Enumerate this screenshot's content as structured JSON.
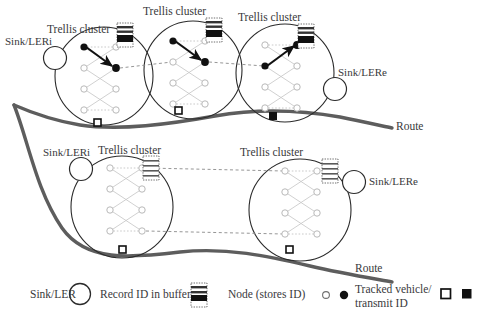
{
  "figure": {
    "colors": {
      "route": "#5d5d5d",
      "cluster_outline": "#2b2b2b",
      "node_inactive": "#b9b9b9",
      "node_active": "#111111",
      "trellis_link": "#bdbdbd",
      "dashed_link": "#8a8a8a",
      "text": "#39393b",
      "buffer_fill": "#111111",
      "background": "#ffffff"
    }
  },
  "rows": [
    {
      "id": "top-row",
      "sink_in_label": "Sink/LERi",
      "sink_out_label": "Sink/LERe",
      "route_label": "Route",
      "clusters": [
        {
          "id": "top-cluster-1",
          "label": "Trellis cluster",
          "buffer_filled": true,
          "vehicle_marker": "open"
        },
        {
          "id": "top-cluster-2",
          "label": "Trellis cluster",
          "buffer_filled": true,
          "vehicle_marker": "open"
        },
        {
          "id": "top-cluster-3",
          "label": "Trellis cluster",
          "buffer_filled": true,
          "vehicle_marker": "filled"
        }
      ]
    },
    {
      "id": "bottom-row",
      "sink_in_label": "Sink/LERi",
      "sink_out_label": "Sink/LERe",
      "route_label": "Route",
      "clusters": [
        {
          "id": "bottom-cluster-1",
          "label": "Trellis cluster",
          "buffer_filled": false,
          "vehicle_marker": "open"
        },
        {
          "id": "bottom-cluster-2",
          "label": "Trellis cluster",
          "buffer_filled": false,
          "vehicle_marker": "open"
        }
      ]
    }
  ],
  "legend": {
    "items": [
      {
        "id": "sink-ler",
        "label": "Sink/LER",
        "symbol": "circle-outline"
      },
      {
        "id": "record-buffer",
        "label": "Record ID in buffer",
        "symbol": "striped-buffer"
      },
      {
        "id": "node-stores-id",
        "label": "Node (stores ID)",
        "symbol": "open-and-filled-dot"
      },
      {
        "id": "tracked-vehicle",
        "label": "Tracked vehicle/ transmit ID",
        "symbol": "open-and-filled-square"
      }
    ]
  }
}
